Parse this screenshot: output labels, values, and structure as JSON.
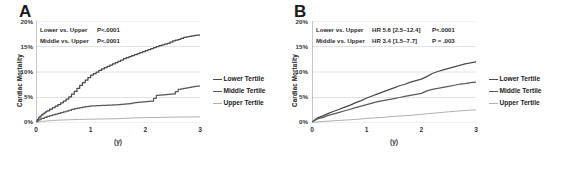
{
  "figure": {
    "panels": [
      {
        "label": "A",
        "yaxis_title": "Cardiac Mortality",
        "xaxis_title": "(y)",
        "yticks": [
          "0%",
          "5%",
          "10%",
          "15%",
          "20%"
        ],
        "xticks": [
          "0",
          "1",
          "2",
          "3"
        ],
        "annotations": [
          {
            "comparison": "Lower vs. Upper",
            "hr": "",
            "p": "P<.0001"
          },
          {
            "comparison": "Middle vs. Upper",
            "hr": "",
            "p": "P<.0001"
          }
        ],
        "legend": [
          {
            "label": "Lower Tertile",
            "color": "#4a4a4a"
          },
          {
            "label": "Middle Tertile",
            "color": "#5a5a5a"
          },
          {
            "label": "Upper Tertile",
            "color": "#b0b0b0"
          }
        ]
      },
      {
        "label": "B",
        "yaxis_title": "Cardiac Mortality",
        "xaxis_title": "(y)",
        "yticks": [
          "0%",
          "5%",
          "10%",
          "15%",
          "20%"
        ],
        "xticks": [
          "0",
          "1",
          "2",
          "3"
        ],
        "annotations": [
          {
            "comparison": "Lower vs. Upper",
            "hr": "HR 5.6 [2.5–12.4]",
            "p": "P<.0001"
          },
          {
            "comparison": "Middle vs. Upper",
            "hr": "HR 3.4 [1.5–7.7]",
            "p": "P = .003"
          }
        ],
        "legend": [
          {
            "label": "Lower Tertile",
            "color": "#4a4a4a"
          },
          {
            "label": "Middle Tertile",
            "color": "#5a5a5a"
          },
          {
            "label": "Upper Tertile",
            "color": "#b0b0b0"
          }
        ]
      }
    ]
  },
  "chart_data": [
    {
      "type": "line",
      "title": "A",
      "xlabel": "(y)",
      "ylabel": "Cardiac Mortality",
      "xlim": [
        0,
        3
      ],
      "ylim": [
        0,
        20
      ],
      "xticks": [
        0,
        1,
        2,
        3
      ],
      "yticks": [
        0,
        5,
        10,
        15,
        20
      ],
      "grid": true,
      "legend_position": "right",
      "annotations": [
        "Lower vs. Upper  P<.0001",
        "Middle vs. Upper  P<.0001"
      ],
      "series": [
        {
          "name": "Lower Tertile",
          "color": "#4a4a4a",
          "x": [
            0,
            0.05,
            0.1,
            0.15,
            0.2,
            0.3,
            0.4,
            0.5,
            0.6,
            0.7,
            0.8,
            0.9,
            1.0,
            1.1,
            1.2,
            1.3,
            1.4,
            1.5,
            1.6,
            1.7,
            1.8,
            1.9,
            2.0,
            2.1,
            2.2,
            2.3,
            2.4,
            2.5,
            2.6,
            2.7,
            2.8,
            2.9,
            3.0
          ],
          "y": [
            0.3,
            1.1,
            1.6,
            2.0,
            2.4,
            3.0,
            3.6,
            4.3,
            5.1,
            6.2,
            7.4,
            8.4,
            9.4,
            10.0,
            10.6,
            11.1,
            11.6,
            12.1,
            12.6,
            13.0,
            13.4,
            13.8,
            14.2,
            14.6,
            15.0,
            15.3,
            15.6,
            16.1,
            16.4,
            16.8,
            17.0,
            17.2,
            17.3
          ]
        },
        {
          "name": "Middle Tertile",
          "color": "#5a5a5a",
          "x": [
            0,
            0.05,
            0.1,
            0.2,
            0.3,
            0.4,
            0.5,
            0.6,
            0.7,
            0.8,
            0.9,
            1.0,
            1.1,
            1.2,
            1.3,
            1.4,
            1.5,
            1.6,
            1.7,
            1.8,
            1.9,
            2.0,
            2.1,
            2.2,
            2.3,
            2.4,
            2.5,
            2.6,
            2.7,
            2.8,
            2.9,
            3.0
          ],
          "y": [
            0.2,
            0.6,
            0.9,
            1.3,
            1.6,
            1.9,
            2.2,
            2.5,
            2.8,
            3.0,
            3.2,
            3.35,
            3.4,
            3.45,
            3.5,
            3.55,
            3.6,
            3.7,
            3.8,
            4.0,
            4.1,
            4.2,
            4.3,
            5.4,
            5.5,
            5.6,
            5.7,
            6.6,
            6.8,
            7.0,
            7.2,
            7.3
          ]
        },
        {
          "name": "Upper Tertile",
          "color": "#b0b0b0",
          "x": [
            0,
            0.1,
            0.3,
            0.5,
            0.8,
            1.0,
            1.3,
            1.5,
            1.8,
            2.0,
            2.3,
            2.5,
            2.8,
            3.0
          ],
          "y": [
            0.1,
            0.3,
            0.5,
            0.6,
            0.7,
            0.75,
            0.8,
            0.85,
            1.0,
            1.05,
            1.1,
            1.15,
            1.18,
            1.2
          ]
        }
      ]
    },
    {
      "type": "line",
      "title": "B",
      "xlabel": "(y)",
      "ylabel": "Cardiac Mortality",
      "xlim": [
        0,
        3
      ],
      "ylim": [
        0,
        20
      ],
      "xticks": [
        0,
        1,
        2,
        3
      ],
      "yticks": [
        0,
        5,
        10,
        15,
        20
      ],
      "grid": true,
      "legend_position": "right",
      "annotations": [
        "Lower vs. Upper  HR 5.6 [2.5–12.4]  P<.0001",
        "Middle vs. Upper  HR 3.4 [1.5–7.7]  P = .003"
      ],
      "series": [
        {
          "name": "Lower Tertile",
          "color": "#4a4a4a",
          "x": [
            0,
            0.1,
            0.2,
            0.3,
            0.4,
            0.5,
            0.6,
            0.7,
            0.8,
            0.9,
            1.0,
            1.1,
            1.2,
            1.3,
            1.4,
            1.5,
            1.6,
            1.7,
            1.8,
            1.9,
            2.0,
            2.1,
            2.2,
            2.3,
            2.4,
            2.5,
            2.6,
            2.7,
            2.8,
            2.9,
            3.0
          ],
          "y": [
            0.2,
            1.0,
            1.4,
            1.9,
            2.3,
            2.7,
            3.1,
            3.5,
            4.0,
            4.4,
            4.9,
            5.3,
            5.7,
            6.1,
            6.5,
            6.9,
            7.3,
            7.6,
            8.0,
            8.3,
            8.6,
            9.1,
            9.7,
            10.1,
            10.4,
            10.7,
            11.0,
            11.3,
            11.6,
            11.8,
            12.0
          ]
        },
        {
          "name": "Middle Tertile",
          "color": "#5a5a5a",
          "x": [
            0,
            0.1,
            0.2,
            0.3,
            0.4,
            0.5,
            0.6,
            0.7,
            0.8,
            0.9,
            1.0,
            1.1,
            1.2,
            1.3,
            1.4,
            1.5,
            1.6,
            1.7,
            1.8,
            1.9,
            2.0,
            2.1,
            2.2,
            2.3,
            2.4,
            2.5,
            2.6,
            2.7,
            2.8,
            2.9,
            3.0
          ],
          "y": [
            0.2,
            0.8,
            1.1,
            1.5,
            1.8,
            2.1,
            2.4,
            2.7,
            3.0,
            3.3,
            3.6,
            3.9,
            4.2,
            4.4,
            4.6,
            4.8,
            5.0,
            5.2,
            5.4,
            5.6,
            5.8,
            6.3,
            6.6,
            6.8,
            7.0,
            7.2,
            7.4,
            7.6,
            7.7,
            7.9,
            8.0
          ]
        },
        {
          "name": "Upper Tertile",
          "color": "#b0b0b0",
          "x": [
            0,
            0.2,
            0.5,
            0.8,
            1.0,
            1.3,
            1.5,
            1.8,
            2.0,
            2.3,
            2.5,
            2.8,
            3.0
          ],
          "y": [
            0.1,
            0.3,
            0.5,
            0.7,
            0.9,
            1.1,
            1.3,
            1.5,
            1.7,
            2.0,
            2.2,
            2.45,
            2.6
          ]
        }
      ]
    }
  ]
}
